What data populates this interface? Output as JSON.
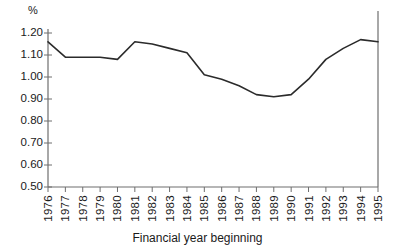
{
  "chart_data": {
    "type": "line",
    "title": "",
    "xlabel": "Financial year beginning",
    "ylabel": "%",
    "unit_symbol": "%",
    "categories": [
      "1976",
      "1977",
      "1978",
      "1979",
      "1980",
      "1981",
      "1982",
      "1983",
      "1984",
      "1985",
      "1986",
      "1987",
      "1988",
      "1989",
      "1990",
      "1991",
      "1992",
      "1993",
      "1994",
      "1995"
    ],
    "values": [
      1.16,
      1.09,
      1.09,
      1.09,
      1.08,
      1.16,
      1.15,
      1.13,
      1.11,
      1.01,
      0.99,
      0.96,
      0.92,
      0.91,
      0.92,
      0.99,
      1.08,
      1.13,
      1.17,
      1.16
    ],
    "series": [
      {
        "name": "value",
        "values": [
          1.16,
          1.09,
          1.09,
          1.09,
          1.08,
          1.16,
          1.15,
          1.13,
          1.11,
          1.01,
          0.99,
          0.96,
          0.92,
          0.91,
          0.92,
          0.99,
          1.08,
          1.13,
          1.17,
          1.16
        ]
      }
    ],
    "ylim": [
      0.5,
      1.2
    ],
    "ytick_labels": [
      "1.20",
      "1.10",
      "1.00",
      "0.90",
      "0.80",
      "0.70",
      "0.60",
      "0.50"
    ],
    "ytick_values": [
      1.2,
      1.1,
      1.0,
      0.9,
      0.8,
      0.7,
      0.6,
      0.5
    ],
    "xtick_labels": [
      "1976",
      "1977",
      "1978",
      "1979",
      "1980",
      "1981",
      "1982",
      "1983",
      "1984",
      "1985",
      "1986",
      "1987",
      "1988",
      "1989",
      "1990",
      "1991",
      "1992",
      "1993",
      "1994",
      "1995"
    ],
    "grid": false,
    "legend": "none",
    "line_color": "#2b2b2b",
    "axis_color": "#6e6e6e"
  }
}
